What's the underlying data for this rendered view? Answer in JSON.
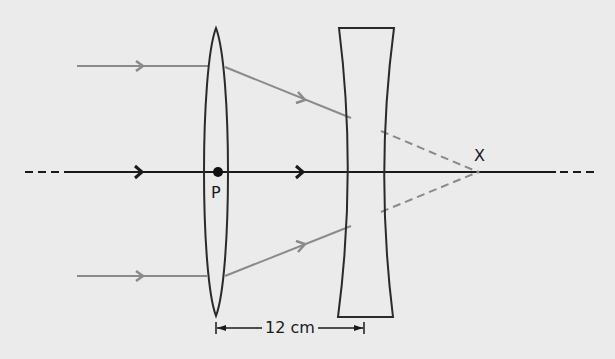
{
  "diagram": {
    "title": "",
    "type": "ray diagram: converging lens followed by diverging lens",
    "labels": {
      "point_p": "P",
      "point_x": "X",
      "distance": "12 cm"
    },
    "elements": {
      "principal_axis": {
        "y": 172,
        "x_start": 25,
        "x_end": 593,
        "style": "solid with dashed ends"
      },
      "convex_lens": {
        "center_x": 216,
        "top_y": 28,
        "bottom_y": 316,
        "half_width_at_axis": 14
      },
      "concave_lens": {
        "left_x_top": 339,
        "right_x_top": 394,
        "top_y": 28,
        "bottom_y": 317,
        "waist_left_x": 351,
        "waist_right_x": 380
      },
      "optical_center_dot": {
        "x": 218,
        "y": 172
      },
      "focal_point": {
        "x": 478,
        "y": 172
      },
      "incident_rays": [
        {
          "y": 66,
          "x_start": 77,
          "x_end": 207,
          "arrow_x": 140
        },
        {
          "y": 276,
          "x_start": 77,
          "x_end": 207,
          "arrow_x": 140
        }
      ],
      "refracted_rays": [
        {
          "from": [
            225,
            67
          ],
          "to": [
            350,
            118
          ],
          "arrow": [
            303,
            99
          ]
        },
        {
          "from": [
            225,
            276
          ],
          "to": [
            350,
            226
          ],
          "arrow": [
            302,
            245
          ]
        }
      ],
      "virtual_rays": [
        {
          "from": [
            381,
            131
          ],
          "to": [
            478,
            172
          ],
          "style": "dashed"
        },
        {
          "from": [
            381,
            212
          ],
          "to": [
            478,
            172
          ],
          "style": "dashed"
        }
      ],
      "axis_arrows_x": [
        140,
        301
      ],
      "dimension_line": {
        "y": 328,
        "x_start": 216,
        "x_end": 364,
        "label": "12 cm"
      }
    },
    "colors": {
      "background": "#ebebeb",
      "axis": "#1a1a1a",
      "lens_outline": "#2a2a2a",
      "ray": "#8a8a8a",
      "dashed_ray": "#8a8a8a"
    }
  }
}
